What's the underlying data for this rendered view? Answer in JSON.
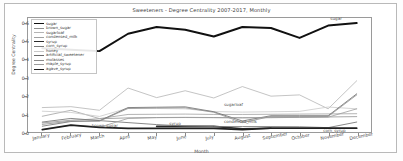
{
  "figure": {
    "title": "Sweeteners - Degree Centrality 2007-2017, Monthly",
    "xlabel": "Month",
    "ylabel": "Degree Centrality"
  },
  "chart_data": {
    "type": "line",
    "title": "Sweeteners - Degree Centrality 2007-2017, Monthly",
    "xlabel": "Month",
    "ylabel": "Degree Centrality",
    "grid": false,
    "legend_position": "upper left",
    "ylim": [
      0.0,
      0.63
    ],
    "yticks": [
      "0.0",
      "0.1",
      "0.2",
      "0.3",
      "0.4",
      "0.5",
      "0.6"
    ],
    "ytick_values": [
      0.0,
      0.1,
      0.2,
      0.3,
      0.4,
      0.5,
      0.6
    ],
    "categories": [
      "January",
      "February",
      "March",
      "April",
      "May",
      "June",
      "July",
      "August",
      "September",
      "October",
      "November",
      "December"
    ],
    "series": [
      {
        "name": "sugar",
        "color": "#111111",
        "width": 2.0,
        "values": [
          0.463,
          0.455,
          0.447,
          0.543,
          0.58,
          0.565,
          0.528,
          0.58,
          0.575,
          0.52,
          0.588,
          0.602
        ]
      },
      {
        "name": "brown_sugar",
        "color": "#8f8f8f",
        "width": 0.8,
        "values": [
          0.05,
          0.065,
          0.073,
          0.078,
          0.08,
          0.081,
          0.08,
          0.078,
          0.079,
          0.081,
          0.083,
          0.085
        ]
      },
      {
        "name": "sugarloaf",
        "color": "#b4b4b4",
        "width": 0.8,
        "values": [
          0.135,
          0.14,
          0.12,
          0.243,
          0.19,
          0.228,
          0.188,
          0.251,
          0.198,
          0.205,
          0.128,
          0.283
        ]
      },
      {
        "name": "condensed_milk",
        "color": "#a0a0a0",
        "width": 0.8,
        "values": [
          0.087,
          0.12,
          0.074,
          0.097,
          0.098,
          0.099,
          0.097,
          0.097,
          0.098,
          0.099,
          0.1,
          0.101
        ]
      },
      {
        "name": "syrup",
        "color": "#2b2b2b",
        "width": 1.6,
        "values": [
          null,
          null,
          null,
          null,
          0.031,
          0.031,
          0.031,
          0.018,
          0.021,
          null,
          null,
          null
        ]
      },
      {
        "name": "corn_syrup",
        "color": "#7a7a7a",
        "width": 0.9,
        "values": [
          0.055,
          0.075,
          0.063,
          0.052,
          0.041,
          0.033,
          0.03,
          0.03,
          0.03,
          0.029,
          0.024,
          0.055
        ]
      },
      {
        "name": "honey",
        "color": "#c8c8c8",
        "width": 0.8,
        "values": [
          0.115,
          0.108,
          0.086,
          0.132,
          0.13,
          0.128,
          0.113,
          0.11,
          0.112,
          0.114,
          0.138,
          0.128
        ]
      },
      {
        "name": "artificial_sweetener",
        "color": "#696969",
        "width": 0.8,
        "values": [
          0.032,
          0.058,
          0.062,
          0.135,
          0.137,
          0.139,
          0.112,
          0.061,
          0.09,
          0.09,
          0.09,
          0.211
        ]
      },
      {
        "name": "molasses",
        "color": "#8b8b8b",
        "width": 0.8,
        "values": [
          0.042,
          0.06,
          0.06,
          0.13,
          0.133,
          0.134,
          0.109,
          0.052,
          0.086,
          0.086,
          0.086,
          0.205
        ]
      },
      {
        "name": "maple_syrup",
        "color": "#9c9c9c",
        "width": 0.8,
        "values": [
          0.013,
          0.038,
          0.026,
          0.075,
          0.079,
          0.08,
          0.079,
          0.079,
          0.08,
          0.081,
          0.082,
          0.128
        ]
      },
      {
        "name": "agave_syrup",
        "color": "#1f1f1f",
        "width": 1.7,
        "values": [
          0.013,
          0.038,
          0.026,
          0.02,
          0.02,
          0.02,
          0.02,
          0.013,
          0.021,
          0.021,
          0.021,
          0.021
        ]
      }
    ],
    "annotations": [
      {
        "text": "sugar",
        "x": 10.55,
        "y": 0.617
      },
      {
        "text": "sugarloaf",
        "x": 6.85,
        "y": 0.15
      },
      {
        "text": "condensed_milk",
        "x": 6.85,
        "y": 0.06
      },
      {
        "text": "brown_sugar",
        "x": 2.25,
        "y": 0.04
      },
      {
        "text": "syrup",
        "x": 4.95,
        "y": 0.047
      },
      {
        "text": "corn_syrup",
        "x": 10.3,
        "y": 0.01
      }
    ]
  },
  "legend": {
    "items": [
      {
        "label": "sugar"
      },
      {
        "label": "brown_sugar"
      },
      {
        "label": "sugarloaf"
      },
      {
        "label": "condensed_milk"
      },
      {
        "label": "syrup"
      },
      {
        "label": "corn_syrup"
      },
      {
        "label": "honey"
      },
      {
        "label": "artificial_sweetener"
      },
      {
        "label": "molasses"
      },
      {
        "label": "maple_syrup"
      },
      {
        "label": "agave_syrup"
      }
    ]
  }
}
